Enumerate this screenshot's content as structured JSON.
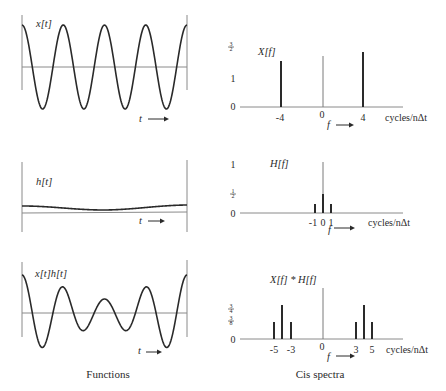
{
  "captions": {
    "left": "Functions",
    "right": "Cis spectra"
  },
  "unit_label": "cycles/nΔt",
  "time_axis_label": "t",
  "freq_axis_label": "f",
  "arrow": "⟶",
  "chart_data": [
    {
      "type": "line",
      "title": "x[t]",
      "panel": "functions",
      "description": "Cosine with 4 cycles across the window, starting at a positive peak",
      "xlabel": "t",
      "cycles": 4,
      "amplitude": 1.0
    },
    {
      "type": "bar",
      "title": "X[f]",
      "panel": "spectra",
      "xlabel": "f",
      "unit": "cycles/nΔt",
      "x": [
        -4,
        0,
        4
      ],
      "values": [
        1.5,
        0,
        1.5
      ],
      "ytick_labels": [
        "0",
        "1",
        "3/2"
      ],
      "yticks": [
        0,
        1,
        1.5
      ],
      "xtick_labels": [
        "-4",
        "0",
        "4"
      ]
    },
    {
      "type": "line",
      "title": "h[t]",
      "panel": "functions",
      "description": "Slowly varying smoothing function: offset plus a low-frequency cosine (one cycle), dipping in the middle",
      "xlabel": "t"
    },
    {
      "type": "bar",
      "title": "H[f]",
      "panel": "spectra",
      "xlabel": "f",
      "unit": "cycles/nΔt",
      "x": [
        -1,
        0,
        1
      ],
      "values": [
        0.25,
        0.5,
        0.25
      ],
      "ytick_labels": [
        "0",
        "1/2",
        "1"
      ],
      "yticks": [
        0,
        0.5,
        1
      ],
      "xtick_labels": [
        "-1",
        "0",
        "1"
      ]
    },
    {
      "type": "line",
      "title": "x[t]h[t]",
      "panel": "functions",
      "description": "Product of x[t] and h[t]: 4-cycle cosine with amplitude modulated, smaller in the middle",
      "xlabel": "t"
    },
    {
      "type": "bar",
      "title": "X[f] * H[f]",
      "panel": "spectra",
      "xlabel": "f",
      "unit": "cycles/nΔt",
      "x": [
        -5,
        -4,
        -3,
        0,
        3,
        4,
        5
      ],
      "values": [
        0.375,
        0.75,
        0.375,
        0,
        0.375,
        0.75,
        0.375
      ],
      "ytick_labels": [
        "0",
        "3/8",
        "3/4"
      ],
      "yticks": [
        0,
        0.375,
        0.75
      ],
      "xtick_labels": [
        "-5",
        "-3",
        "0",
        "3",
        "5"
      ]
    }
  ]
}
